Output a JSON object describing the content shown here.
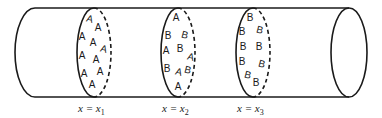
{
  "diagram": {
    "cylinder": {
      "top_y": 8,
      "bottom_y": 97,
      "left_cap_x": 15,
      "right_cap_cx": 349
    },
    "sections": [
      {
        "label_var": "x = x",
        "label_sub": "1",
        "cx": 94,
        "particles": [
          {
            "t": "A",
            "x": 89,
            "y": 22,
            "r": 15
          },
          {
            "t": "A",
            "x": 98,
            "y": 31,
            "r": 0
          },
          {
            "t": "A",
            "x": 82,
            "y": 40,
            "r": 0
          },
          {
            "t": "A",
            "x": 93,
            "y": 46,
            "r": 0
          },
          {
            "t": "A",
            "x": 103,
            "y": 52,
            "r": 15
          },
          {
            "t": "A",
            "x": 82,
            "y": 59,
            "r": 0
          },
          {
            "t": "A",
            "x": 96,
            "y": 63,
            "r": 0
          },
          {
            "t": "A",
            "x": 100,
            "y": 75,
            "r": 0
          },
          {
            "t": "A",
            "x": 84,
            "y": 77,
            "r": 0
          },
          {
            "t": "A",
            "x": 92,
            "y": 88,
            "r": 0
          }
        ]
      },
      {
        "label_var": "x = x",
        "label_sub": "2",
        "cx": 178,
        "particles": [
          {
            "t": "A",
            "x": 176,
            "y": 21,
            "r": 0
          },
          {
            "t": "B",
            "x": 168,
            "y": 39,
            "r": 0
          },
          {
            "t": "B",
            "x": 184,
            "y": 38,
            "r": 15
          },
          {
            "t": "A",
            "x": 166,
            "y": 54,
            "r": 0
          },
          {
            "t": "B",
            "x": 180,
            "y": 52,
            "r": 0
          },
          {
            "t": "A",
            "x": 190,
            "y": 60,
            "r": 15
          },
          {
            "t": "B",
            "x": 167,
            "y": 72,
            "r": 0
          },
          {
            "t": "A",
            "x": 178,
            "y": 75,
            "r": 15
          },
          {
            "t": "B",
            "x": 187,
            "y": 73,
            "r": 15
          },
          {
            "t": "A",
            "x": 178,
            "y": 90,
            "r": 0
          }
        ]
      },
      {
        "label_var": "x = x",
        "label_sub": "3",
        "cx": 253,
        "particles": [
          {
            "t": "B",
            "x": 250,
            "y": 21,
            "r": 0
          },
          {
            "t": "B",
            "x": 242,
            "y": 35,
            "r": 0
          },
          {
            "t": "B",
            "x": 259,
            "y": 33,
            "r": 15
          },
          {
            "t": "B",
            "x": 243,
            "y": 50,
            "r": 0
          },
          {
            "t": "B",
            "x": 259,
            "y": 50,
            "r": 0
          },
          {
            "t": "B",
            "x": 242,
            "y": 65,
            "r": 0
          },
          {
            "t": "B",
            "x": 261,
            "y": 67,
            "r": 15
          },
          {
            "t": "B",
            "x": 247,
            "y": 78,
            "r": 15
          },
          {
            "t": "B",
            "x": 256,
            "y": 86,
            "r": 0
          }
        ]
      }
    ]
  }
}
